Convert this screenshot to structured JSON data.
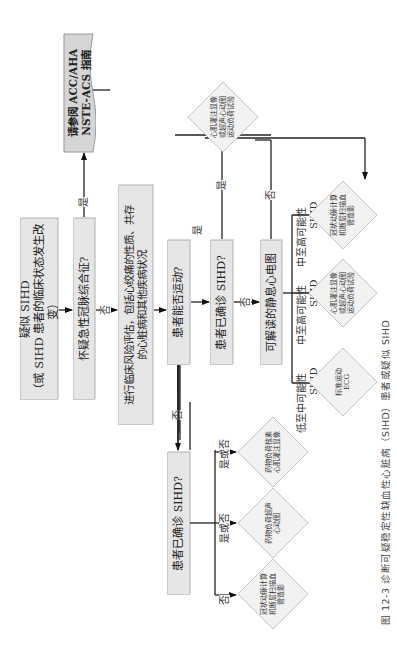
{
  "flowchart": {
    "start": {
      "line1": "疑似 SIHD",
      "line2": "（或 SIHD 患者的临床状态发生改变）"
    },
    "acs_question": "怀疑急性冠脉综合征?",
    "guideline": {
      "line1": "请参阅 ACC/AHA",
      "line2": "NSTE-ACS 指南"
    },
    "risk_assessment": {
      "line1": "进行临床风险评估，包括心绞痛的性质、共存",
      "line2": "的心脏病和其他疾病状况"
    },
    "exercise_question": "患者能否运动?",
    "confirmed_question_exercise": "患者已确诊 SIHD?",
    "confirmed_question_no_exercise": "患者已确诊 SIHD?",
    "ecg_question": "可解读的静息心电图",
    "yes_label": "是",
    "no_label": "否",
    "yes_or_no_label": "是或否",
    "probability_categories": [
      {
        "line1": "低至中可能性",
        "line2": "SIHD"
      },
      {
        "line1": "中至高可能性",
        "line2": "SIHD"
      },
      {
        "line1": "中至高可能性",
        "line2": "SIHD"
      }
    ],
    "tests": {
      "imaging_exercise_top": "心肌灌注显像或超声心动图运动负荷试验",
      "standard_exercise_ecg": "标准运动 ECG",
      "imaging_exercise_mid": "心肌灌注显像或超声心动图运动负荷试验",
      "coronary_ct_right": "冠状动脉计算机断层扫描血管造影",
      "pharm_nuclear": "药物负荷核素心肌灌注显像",
      "pharm_echo": "药物负荷超声心动图",
      "coronary_ct_bottom": "冠状动脉计算机断层扫描血管造影"
    }
  },
  "caption": "图 12-3  诊断可疑稳定性缺血性心脏病（SIHD）患者或疑似 SIHD"
}
